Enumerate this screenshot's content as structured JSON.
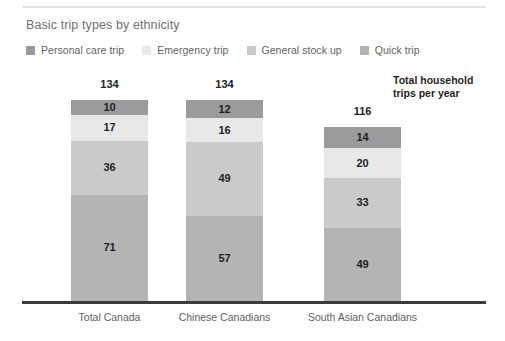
{
  "chart_data": {
    "type": "bar",
    "subtype": "stacked-vertical",
    "title": "Basic trip types by ethnicity",
    "xlabel": "",
    "ylabel": "",
    "grid": false,
    "legend_position": "top-left",
    "annotation": {
      "line1": "Total household",
      "line2": "trips per year"
    },
    "categories": [
      "Total Canada",
      "Chinese Canadians",
      "South Asian Canadians"
    ],
    "totals": [
      134,
      134,
      116
    ],
    "ylim": [
      0,
      134
    ],
    "stack_order_bottom_to_top": [
      "Quick trip",
      "General stock up",
      "Emergency trip",
      "Personal care trip"
    ],
    "series": [
      {
        "name": "Personal care trip",
        "color": "#9b9b9e",
        "values": [
          10,
          12,
          14
        ]
      },
      {
        "name": "Emergency trip",
        "color": "#e8e8e9",
        "values": [
          17,
          16,
          20
        ]
      },
      {
        "name": "General stock up",
        "color": "#cacacb",
        "values": [
          36,
          49,
          33
        ]
      },
      {
        "name": "Quick trip",
        "color": "#b4b4b5",
        "values": [
          71,
          57,
          49
        ]
      }
    ]
  },
  "legend": {
    "items": [
      {
        "label": "Personal care trip",
        "color": "#9b9b9e"
      },
      {
        "label": "Emergency trip",
        "color": "#e8e8e9"
      },
      {
        "label": "General stock up",
        "color": "#cacacb"
      },
      {
        "label": "Quick trip",
        "color": "#b4b4b5"
      }
    ]
  },
  "colors": {
    "axis": "#3b3b3f",
    "top_rule": "#e3e3e6",
    "title_text": "#6f6f73",
    "label_text": "#5f5f63",
    "value_text": "#1f1f23",
    "background": "#ffffff"
  }
}
